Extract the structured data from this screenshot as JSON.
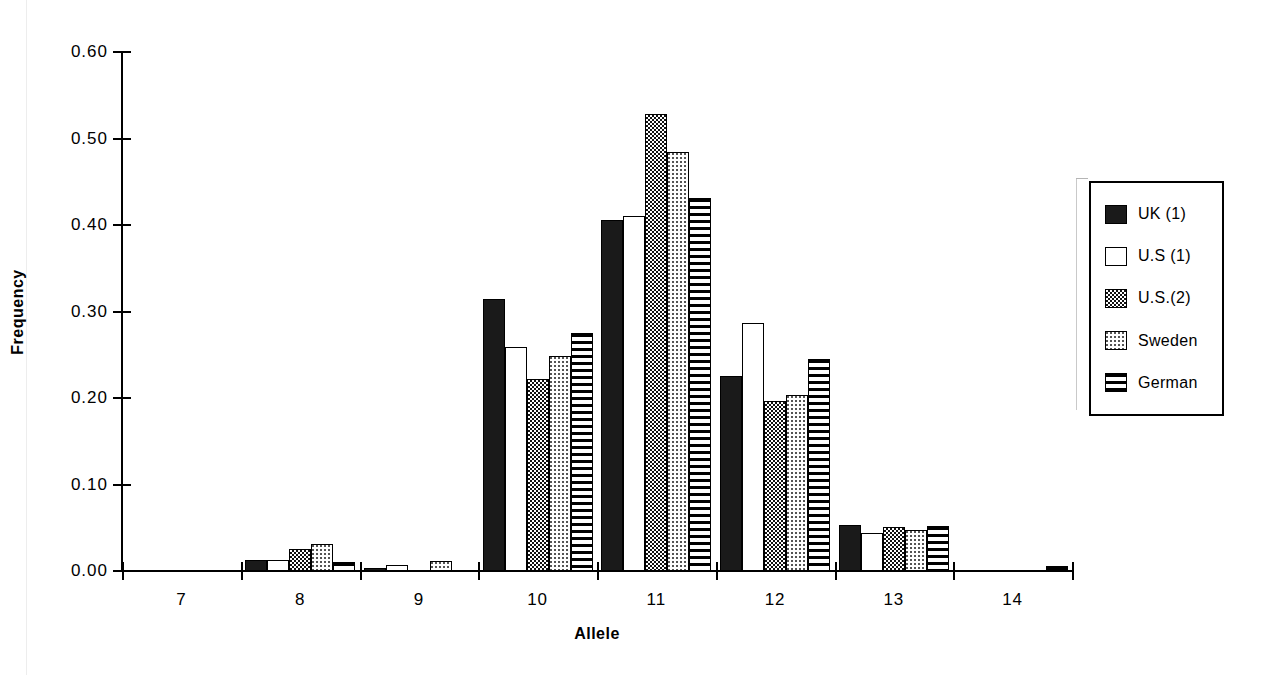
{
  "chart_data": {
    "type": "bar",
    "title": "",
    "xlabel": "Allele",
    "ylabel": "Frequency",
    "categories": [
      "7",
      "8",
      "9",
      "10",
      "11",
      "12",
      "13",
      "14"
    ],
    "ylim": [
      0.0,
      0.6
    ],
    "yticks": [
      "0.00",
      "0.10",
      "0.20",
      "0.30",
      "0.40",
      "0.50",
      "0.60"
    ],
    "ytick_values": [
      0.0,
      0.1,
      0.2,
      0.3,
      0.4,
      0.5,
      0.6
    ],
    "grid": false,
    "legend_position": "right",
    "series": [
      {
        "name": "UK (1)",
        "pattern": "solid-black",
        "values": [
          0.0,
          0.013,
          0.003,
          0.315,
          0.406,
          0.226,
          0.053,
          0.0
        ]
      },
      {
        "name": "U.S (1)",
        "pattern": "white-empty",
        "values": [
          0.0,
          0.013,
          0.007,
          0.259,
          0.41,
          0.287,
          0.044,
          0.0
        ]
      },
      {
        "name": "U.S.(2)",
        "pattern": "dark-checker",
        "values": [
          0.0,
          0.025,
          0.0,
          0.222,
          0.528,
          0.196,
          0.051,
          0.0
        ]
      },
      {
        "name": "Sweden",
        "pattern": "light-stipple",
        "values": [
          0.0,
          0.031,
          0.012,
          0.248,
          0.484,
          0.203,
          0.047,
          0.0
        ]
      },
      {
        "name": "German",
        "pattern": "horizontal-stripes",
        "values": [
          0.0,
          0.011,
          0.0,
          0.275,
          0.431,
          0.245,
          0.052,
          0.006
        ]
      }
    ]
  },
  "legend": {
    "items": [
      {
        "label": "UK (1)"
      },
      {
        "label": "U.S (1)"
      },
      {
        "label": "U.S.(2)"
      },
      {
        "label": "Sweden"
      },
      {
        "label": "German"
      }
    ]
  }
}
